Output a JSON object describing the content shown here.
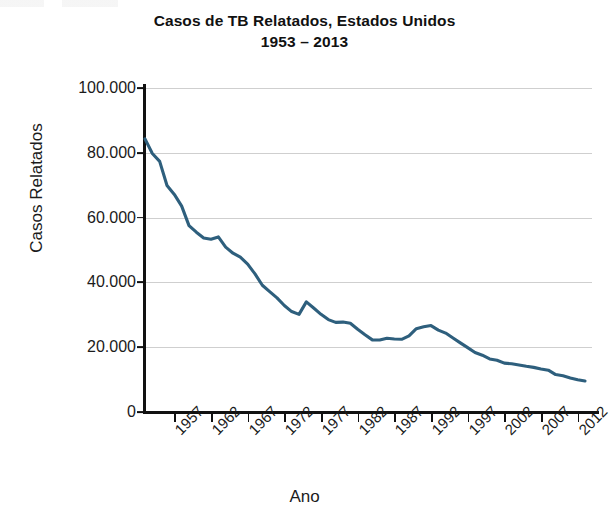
{
  "chart_data": {
    "type": "line",
    "title": "Casos de TB Relatados, Estados Unidos",
    "subtitle": "1953 – 2013",
    "xlabel": "Ano",
    "ylabel": "Casos Relatados",
    "xlim": [
      1953,
      2013
    ],
    "ylim": [
      0,
      100000
    ],
    "grid": "horizontal",
    "legend": "none",
    "line_color": "#2e5f7d",
    "ytick_labels": [
      "0",
      "20.000",
      "40.000",
      "60.000",
      "80.000",
      "100.000"
    ],
    "ytick_values": [
      0,
      20000,
      40000,
      60000,
      80000,
      100000
    ],
    "xtick_labels": [
      "1957",
      "1962",
      "1967",
      "1972",
      "1977",
      "1982",
      "1987",
      "1992",
      "1997",
      "2002",
      "2007",
      "2012"
    ],
    "xtick_values": [
      1957,
      1962,
      1967,
      1972,
      1977,
      1982,
      1987,
      1992,
      1997,
      2002,
      2007,
      2012
    ],
    "x": [
      1953,
      1954,
      1955,
      1956,
      1957,
      1958,
      1959,
      1960,
      1961,
      1962,
      1963,
      1964,
      1965,
      1966,
      1967,
      1968,
      1969,
      1970,
      1971,
      1972,
      1973,
      1974,
      1975,
      1976,
      1977,
      1978,
      1979,
      1980,
      1981,
      1982,
      1983,
      1984,
      1985,
      1986,
      1987,
      1988,
      1989,
      1990,
      1991,
      1992,
      1993,
      1994,
      1995,
      1996,
      1997,
      1998,
      1999,
      2000,
      2001,
      2002,
      2003,
      2004,
      2005,
      2006,
      2007,
      2008,
      2009,
      2010,
      2011,
      2012,
      2013
    ],
    "series": [
      {
        "name": "Casos de TB relatados",
        "values": [
          84304,
          79775,
          77368,
          69895,
          67149,
          63534,
          57535,
          55494,
          53726,
          53315,
          54042,
          50874,
          49016,
          47767,
          45647,
          42623,
          39120,
          37137,
          35217,
          32882,
          30998,
          30122,
          33989,
          32105,
          30145,
          28521,
          27669,
          27749,
          27373,
          25520,
          23846,
          22255,
          22201,
          22768,
          22517,
          22436,
          23495,
          25701,
          26283,
          26673,
          25287,
          24361,
          22860,
          21337,
          19855,
          18361,
          17531,
          16377,
          15989,
          15075,
          14874,
          14517,
          14097,
          13779,
          13299,
          12904,
          11545,
          11182,
          10521,
          9945,
          9582
        ]
      }
    ]
  }
}
